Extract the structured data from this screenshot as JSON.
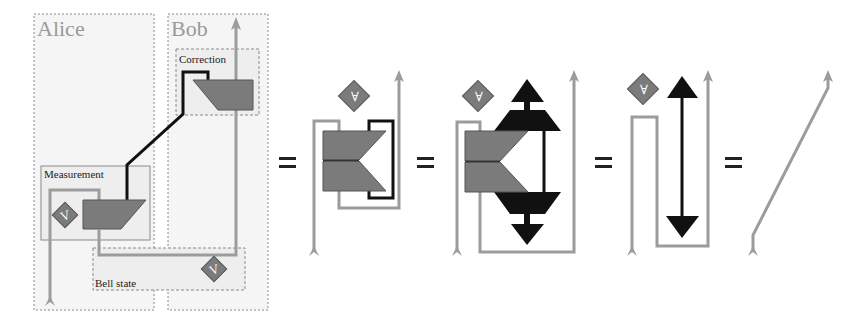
{
  "figure": {
    "colors": {
      "wire": "#9c9c9c",
      "classical_wire": "#111111",
      "gate_fill": "#7b7b7b",
      "diamond_fill": "#7b7b7b",
      "region_fill": "#f4f4f4",
      "region_border": "#8a8a8a",
      "equals": "#222222"
    },
    "panels": [
      {
        "id": "teleportation-protocol",
        "parties": [
          {
            "label": "Alice"
          },
          {
            "label": "Bob"
          }
        ],
        "boxes": [
          {
            "label": "Correction"
          },
          {
            "label": "Measurement"
          },
          {
            "label": "Bell state"
          }
        ],
        "diamonds": [
          {
            "glyph": "V",
            "role": "measurement-unitary"
          },
          {
            "glyph": "V",
            "role": "bell-state-unitary"
          }
        ]
      },
      {
        "id": "step-1",
        "diamonds": [
          {
            "glyph": "∀"
          }
        ]
      },
      {
        "id": "step-2",
        "diamonds": [
          {
            "glyph": "∀"
          }
        ]
      },
      {
        "id": "step-3",
        "diamonds": [
          {
            "glyph": "∀"
          }
        ]
      },
      {
        "id": "identity-wire"
      }
    ],
    "equals_signs": [
      "=",
      "=",
      "=",
      "="
    ]
  }
}
